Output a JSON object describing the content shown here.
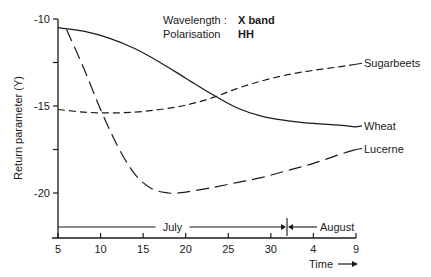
{
  "chart_data": {
    "type": "line",
    "title": "",
    "annotations": [
      {
        "label": "Wavelength :",
        "value": "X band"
      },
      {
        "label": "Polarisation",
        "value": "HH"
      }
    ],
    "xlabel": "Time",
    "ylabel": "Return parameter (Y)",
    "x_unit": "day offset from 1 July (July 5 = 5, Aug 9 = 40)",
    "xlim": [
      5,
      40
    ],
    "ylim": [
      -22.5,
      -10
    ],
    "x_ticks": [
      {
        "value": 5,
        "label": "5"
      },
      {
        "value": 10,
        "label": "10"
      },
      {
        "value": 15,
        "label": "15"
      },
      {
        "value": 20,
        "label": "20"
      },
      {
        "value": 25,
        "label": "25"
      },
      {
        "value": 30,
        "label": "30"
      },
      {
        "value": 35,
        "label": "4"
      },
      {
        "value": 40,
        "label": "9"
      }
    ],
    "y_ticks": [
      {
        "value": -10,
        "label": "-10"
      },
      {
        "value": -12.5,
        "label": ""
      },
      {
        "value": -15,
        "label": "-15"
      },
      {
        "value": -17.5,
        "label": ""
      },
      {
        "value": -20,
        "label": "-20"
      }
    ],
    "months": [
      {
        "name": "July",
        "from": 5,
        "to": 31.9
      },
      {
        "name": "August",
        "from": 31.9,
        "to": 40
      }
    ],
    "grid": false,
    "legend": "inline labels at right end of each curve",
    "series": [
      {
        "name": "Wheat",
        "style": "solid",
        "x": [
          5,
          8,
          11,
          14,
          17,
          20,
          23,
          26,
          29,
          32,
          35,
          38,
          40
        ],
        "y": [
          -10.5,
          -10.7,
          -11.1,
          -11.7,
          -12.5,
          -13.4,
          -14.3,
          -15.1,
          -15.6,
          -15.85,
          -16.0,
          -16.1,
          -16.2
        ]
      },
      {
        "name": "Sugarbeets",
        "style": "short-dash",
        "x": [
          5,
          8,
          11,
          14,
          17,
          20,
          23,
          26,
          29,
          32,
          35,
          38,
          40
        ],
        "y": [
          -15.2,
          -15.35,
          -15.4,
          -15.35,
          -15.2,
          -14.95,
          -14.55,
          -14.0,
          -13.55,
          -13.2,
          -12.95,
          -12.75,
          -12.6
        ]
      },
      {
        "name": "Lucerne",
        "style": "long-dash",
        "x": [
          6,
          8,
          10,
          12,
          14,
          16,
          18,
          19,
          20,
          23,
          26,
          29,
          32,
          35,
          38,
          40
        ],
        "y": [
          -10.6,
          -12.8,
          -15.2,
          -17.3,
          -18.9,
          -19.75,
          -20.0,
          -20.0,
          -19.95,
          -19.7,
          -19.4,
          -19.1,
          -18.7,
          -18.3,
          -17.8,
          -17.5
        ]
      }
    ]
  }
}
